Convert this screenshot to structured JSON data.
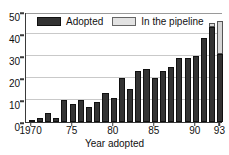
{
  "chart_data": {
    "type": "bar",
    "title": "",
    "xlabel": "Year adopted",
    "ylabel": "",
    "stacked": true,
    "grid": true,
    "legend_position": "top-inside",
    "ylim": [
      0,
      50
    ],
    "yticks": [
      0,
      10,
      20,
      30,
      40,
      50
    ],
    "xticks": [
      "1970",
      "75",
      "80",
      "85",
      "90",
      "93"
    ],
    "xtick_years": [
      1970,
      1975,
      1980,
      1985,
      1990,
      1993
    ],
    "categories": [
      "1970",
      "1971",
      "1972",
      "1973",
      "1974",
      "1975",
      "1976",
      "1977",
      "1978",
      "1979",
      "1980",
      "1981",
      "1982",
      "1983",
      "1984",
      "1985",
      "1986",
      "1987",
      "1988",
      "1989",
      "1990",
      "1991",
      "1992",
      "1993"
    ],
    "series": [
      {
        "name": "Adopted",
        "color": "#333333",
        "values": [
          1,
          2,
          4,
          2,
          10,
          8,
          10,
          7,
          9,
          13,
          11,
          20,
          15,
          23,
          24,
          20,
          23,
          25,
          29,
          29,
          30,
          38,
          43,
          31
        ]
      },
      {
        "name": "In the pipeline",
        "color": "#d6d6d6",
        "values": [
          0,
          0,
          0,
          0,
          0,
          0,
          0,
          0,
          0,
          0,
          0,
          0,
          0,
          0,
          0,
          0,
          0,
          0,
          0,
          0,
          0,
          0,
          2,
          15
        ]
      }
    ]
  },
  "legend": {
    "items": [
      {
        "label": "Adopted",
        "swatch": "dark"
      },
      {
        "label": "In the pipeline",
        "swatch": "light"
      }
    ]
  },
  "axis": {
    "x_title": "Year adopted"
  }
}
